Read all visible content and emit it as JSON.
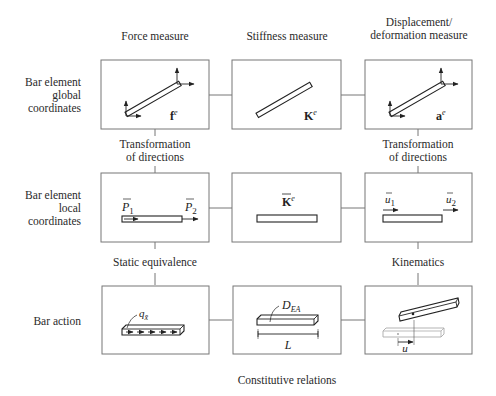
{
  "columns": {
    "force": "Force measure",
    "stiffness": "Stiffness measure",
    "displacement_line1": "Displacement/",
    "displacement_line2": "deformation measure"
  },
  "rows": {
    "global": [
      "Bar element",
      "global",
      "coordinates"
    ],
    "local": [
      "Bar element",
      "local",
      "coordinates"
    ],
    "action": "Bar action"
  },
  "relations": {
    "transform_left": [
      "Transformation",
      "of directions"
    ],
    "transform_right": [
      "Transformation",
      "of directions"
    ],
    "static_equivalence": "Static equivalence",
    "kinematics": "Kinematics",
    "constitutive": "Constitutive relations"
  },
  "symbols": {
    "global_force": {
      "base": "f",
      "sup": "e"
    },
    "global_stiffness": {
      "base": "K",
      "sup": "e"
    },
    "global_displacement": {
      "base": "a",
      "sup": "e"
    },
    "local_force_1": {
      "base": "P",
      "sub": "1"
    },
    "local_force_2": {
      "base": "P",
      "sub": "2"
    },
    "local_stiffness": {
      "base": "K",
      "sup": "e"
    },
    "local_disp_1": {
      "base": "u",
      "sub": "1"
    },
    "local_disp_2": {
      "base": "u",
      "sub": "2"
    },
    "distributed_load": {
      "base": "q",
      "sub": "x̄"
    },
    "axial_stiffness": {
      "base": "D",
      "sub": "EA"
    },
    "length": "L",
    "axial_displacement": "u"
  }
}
